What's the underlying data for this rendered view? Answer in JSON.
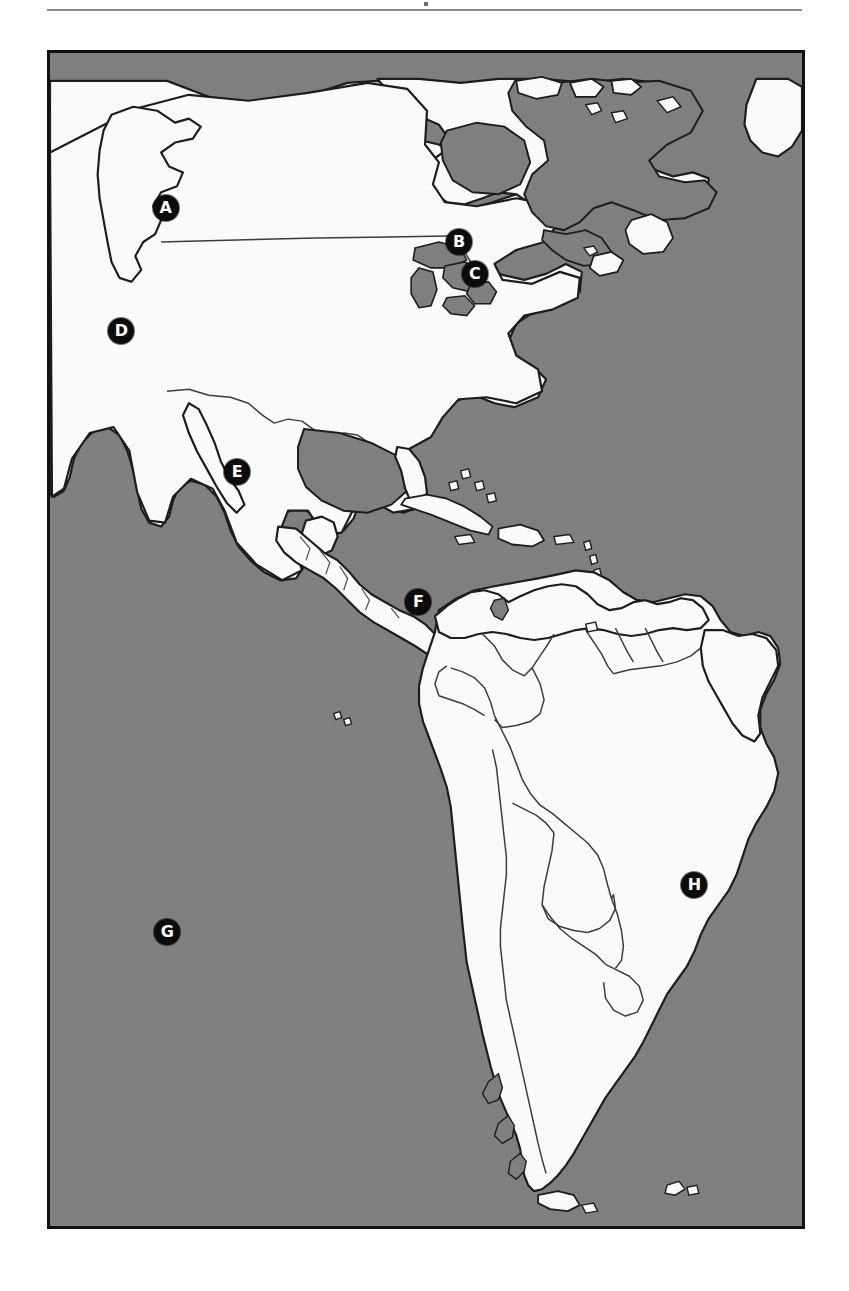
{
  "page": {
    "header_rule_mark": "·",
    "figure_label": "Map of the Americas"
  },
  "map": {
    "ocean_color": "#808080",
    "land_color": "#ffffff",
    "outline_color": "#1a1a1a",
    "border_color": "#111111",
    "marker_fill": "#0c0c0c",
    "marker_text_color": "#ffffff",
    "markers": [
      {
        "label": "A",
        "x_pct": 15.4,
        "y_pct": 13.2,
        "region": "pacific-northwest-usa"
      },
      {
        "label": "B",
        "x_pct": 54.4,
        "y_pct": 16.1,
        "region": "great-lakes-canada"
      },
      {
        "label": "C",
        "x_pct": 56.5,
        "y_pct": 18.8,
        "region": "northeast-usa"
      },
      {
        "label": "D",
        "x_pct": 9.5,
        "y_pct": 23.7,
        "region": "california-usa"
      },
      {
        "label": "E",
        "x_pct": 24.9,
        "y_pct": 35.7,
        "region": "central-mexico"
      },
      {
        "label": "F",
        "x_pct": 49.0,
        "y_pct": 46.8,
        "region": "northwest-colombia"
      },
      {
        "label": "G",
        "x_pct": 15.6,
        "y_pct": 74.9,
        "region": "south-pacific-ocean"
      },
      {
        "label": "H",
        "x_pct": 85.7,
        "y_pct": 70.9,
        "region": "southeast-brazil"
      }
    ]
  }
}
